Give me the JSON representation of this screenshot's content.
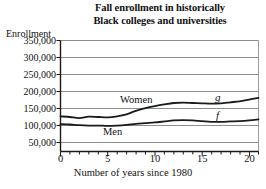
{
  "chart": {
    "title_line1": "Fall enrollment in historically",
    "title_line2": "Black colleges and universities",
    "ylabel": "Enrollment",
    "xlabel": "Number of years since 1980",
    "ytick_labels": [
      "350,000",
      "300,000",
      "250,000",
      "200,000",
      "150,000",
      "100,000",
      "50,000"
    ],
    "xtick_labels": [
      "0",
      "5",
      "10",
      "15",
      "20"
    ],
    "series_label_women": "Women",
    "series_label_men": "Men",
    "series_label_g": "g",
    "series_label_f": "f",
    "line_color": "#1a1a1a",
    "grid_color": "#8c8c8c",
    "axis_color": "#1a1a1a",
    "background_color": "#ffffff"
  },
  "chart_data": {
    "type": "line",
    "title": "Fall enrollment in historically Black colleges and universities",
    "xlabel": "Number of years since 1980",
    "ylabel": "Enrollment",
    "xlim": [
      0,
      21
    ],
    "ylim": [
      25000,
      350000
    ],
    "xticks": [
      0,
      5,
      10,
      15,
      20
    ],
    "xminor_ticks": [
      0,
      1,
      2,
      3,
      4,
      5,
      6,
      7,
      8,
      9,
      10,
      11,
      12,
      13,
      14,
      15,
      16,
      17,
      18,
      19,
      20,
      21
    ],
    "yticks": [
      50000,
      100000,
      150000,
      200000,
      250000,
      300000,
      350000
    ],
    "grid": "horizontal",
    "legend": "inline-labels",
    "x": [
      0,
      1,
      2,
      3,
      4,
      5,
      6,
      7,
      8,
      9,
      10,
      11,
      12,
      13,
      14,
      15,
      16,
      17,
      18,
      19,
      20,
      21
    ],
    "series": [
      {
        "name": "Women",
        "label": "g",
        "values": [
          128000,
          126000,
          123000,
          127000,
          126000,
          125000,
          128000,
          134000,
          144000,
          152000,
          158000,
          163000,
          167000,
          168000,
          167000,
          166000,
          165000,
          166000,
          169000,
          172000,
          177000,
          182000
        ]
      },
      {
        "name": "Men",
        "label": "f",
        "values": [
          105000,
          104000,
          102000,
          101000,
          101000,
          100000,
          101000,
          103000,
          106000,
          108000,
          110000,
          113000,
          116000,
          117000,
          116000,
          114000,
          112000,
          112000,
          113000,
          114000,
          116000,
          119000
        ]
      }
    ]
  }
}
